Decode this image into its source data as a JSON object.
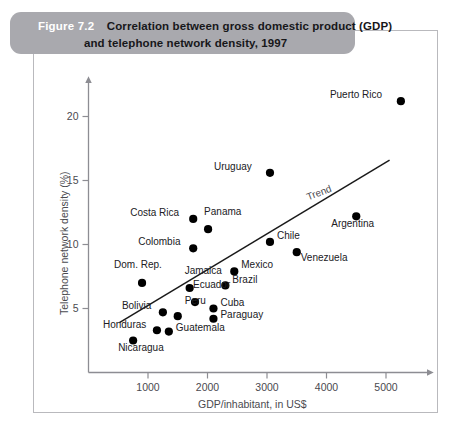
{
  "figure": {
    "number": "Figure 7.2",
    "title_line1": "Correlation between gross domestic product (GDP)",
    "title_line2": "and telephone network density, 1997",
    "banner_color": "#a9a9ae",
    "frame_color": "#b9b9bd"
  },
  "chart_data": {
    "type": "scatter",
    "title": "Correlation between gross domestic product (GDP) and telephone network density, 1997",
    "xlabel": "GDP/inhabitant, in US$",
    "ylabel": "Telephone network density (%)",
    "xlim": [
      0,
      5600
    ],
    "ylim": [
      0,
      22.5
    ],
    "xticks": [
      "1000",
      "2000",
      "3000",
      "4000",
      "5000"
    ],
    "xtick_values": [
      1000,
      2000,
      3000,
      4000,
      5000
    ],
    "yticks": [
      "5",
      "10",
      "15",
      "20"
    ],
    "ytick_values": [
      5,
      10,
      15,
      20
    ],
    "grid": false,
    "legend": false,
    "marker": "filled-circle",
    "marker_color": "#000000",
    "points": [
      {
        "name": "Puerto Rico",
        "x": 5250,
        "y": 21.2,
        "label_side": "left"
      },
      {
        "name": "Uruguay",
        "x": 3050,
        "y": 15.6,
        "label_side": "left"
      },
      {
        "name": "Argentina",
        "x": 4500,
        "y": 12.2,
        "label_side": "below"
      },
      {
        "name": "Costa Rica",
        "x": 1760,
        "y": 12.0,
        "label_side": "left"
      },
      {
        "name": "Panama",
        "x": 2010,
        "y": 11.2,
        "label_side": "above-right"
      },
      {
        "name": "Chile",
        "x": 3050,
        "y": 10.2,
        "label_side": "right"
      },
      {
        "name": "Venezuela",
        "x": 3500,
        "y": 9.4,
        "label_side": "below-right"
      },
      {
        "name": "Colombia",
        "x": 1760,
        "y": 9.7,
        "label_side": "left"
      },
      {
        "name": "Mexico",
        "x": 2450,
        "y": 7.9,
        "label_side": "right"
      },
      {
        "name": "Dom. Rep.",
        "x": 900,
        "y": 7.0,
        "label_side": "above"
      },
      {
        "name": "Brazil",
        "x": 2300,
        "y": 6.8,
        "label_side": "right"
      },
      {
        "name": "Jamaica",
        "x": 1700,
        "y": 6.6,
        "label_side": "above"
      },
      {
        "name": "Ecuador",
        "x": 1790,
        "y": 5.5,
        "label_side": "above-right"
      },
      {
        "name": "Cuba",
        "x": 2100,
        "y": 5.0,
        "label_side": "right"
      },
      {
        "name": "Bolivia",
        "x": 1250,
        "y": 4.7,
        "label_side": "left"
      },
      {
        "name": "Peru",
        "x": 1500,
        "y": 4.4,
        "label_side": "above-left"
      },
      {
        "name": "Paraguay",
        "x": 2100,
        "y": 4.2,
        "label_side": "right"
      },
      {
        "name": "Honduras",
        "x": 1150,
        "y": 3.3,
        "label_side": "left"
      },
      {
        "name": "Guatemala",
        "x": 1350,
        "y": 3.2,
        "label_side": "right"
      },
      {
        "name": "Nicaragua",
        "x": 750,
        "y": 2.5,
        "label_side": "below"
      }
    ],
    "trendline": {
      "label": "Trend",
      "x_start": 520,
      "y_start": 3.9,
      "x_end": 5060,
      "y_end": 16.6,
      "color": "#1a1a1a"
    }
  }
}
